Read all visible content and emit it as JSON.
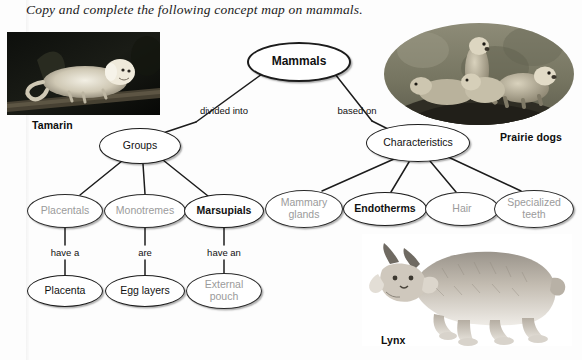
{
  "page": {
    "instruction": "Copy and complete the following concept map on mammals.",
    "background": "#ffffff",
    "ink": "#111111",
    "blank_color": "#9b9b9b"
  },
  "photos": [
    {
      "id": "tamarin",
      "caption": "Tamarin",
      "shape": "rectangle",
      "subject": "white-headed tamarin monkey lying on a branch"
    },
    {
      "id": "prairie-dogs",
      "caption": "Prairie dogs",
      "shape": "ellipse",
      "subject": "four prairie dogs standing on a burrow mound"
    },
    {
      "id": "lynx",
      "caption": "Lynx",
      "shape": "cutout",
      "subject": "canada lynx walking, cut out on white"
    }
  ],
  "concept_map": {
    "title_node": "Mammals",
    "nodes": [
      {
        "id": "mammals",
        "label": "Mammals",
        "style": "root",
        "x": 299,
        "y": 62,
        "w": 104,
        "h": 40
      },
      {
        "id": "groups",
        "label": "Groups",
        "style": "plain",
        "x": 140,
        "y": 146,
        "w": 82,
        "h": 36
      },
      {
        "id": "characteristics",
        "label": "Characteristics",
        "style": "plain",
        "x": 418,
        "y": 143,
        "w": 104,
        "h": 38
      },
      {
        "id": "placentals",
        "label": "Placentals",
        "style": "blank",
        "x": 65,
        "y": 211,
        "w": 76,
        "h": 34
      },
      {
        "id": "monotremes",
        "label": "Monotremes",
        "style": "blank",
        "x": 145,
        "y": 211,
        "w": 82,
        "h": 34
      },
      {
        "id": "marsupials",
        "label": "Marsupials",
        "style": "bold",
        "x": 224,
        "y": 211,
        "w": 80,
        "h": 34
      },
      {
        "id": "placenta",
        "label": "Placenta",
        "style": "plain",
        "x": 65,
        "y": 291,
        "w": 76,
        "h": 32
      },
      {
        "id": "egg-layers",
        "label": "Egg layers",
        "style": "plain",
        "x": 145,
        "y": 291,
        "w": 80,
        "h": 32
      },
      {
        "id": "external-pouch",
        "label": "External\npouch",
        "style": "blank",
        "x": 224,
        "y": 291,
        "w": 76,
        "h": 36
      },
      {
        "id": "mammary-glands",
        "label": "Mammary\nglands",
        "style": "blank",
        "x": 304,
        "y": 209,
        "w": 78,
        "h": 38
      },
      {
        "id": "endotherms",
        "label": "Endotherms",
        "style": "bold",
        "x": 385,
        "y": 209,
        "w": 84,
        "h": 34
      },
      {
        "id": "hair",
        "label": "Hair",
        "style": "blank",
        "x": 462,
        "y": 209,
        "w": 74,
        "h": 34
      },
      {
        "id": "specialized-teeth",
        "label": "Specialized\nteeth",
        "style": "blank",
        "x": 534,
        "y": 209,
        "w": 80,
        "h": 38
      }
    ],
    "edge_labels": [
      {
        "id": "divided-into",
        "label": "divided into",
        "x": 224,
        "y": 110
      },
      {
        "id": "based-on",
        "label": "based on",
        "x": 357,
        "y": 110
      },
      {
        "id": "have-a",
        "label": "have a",
        "x": 65,
        "y": 252
      },
      {
        "id": "are",
        "label": "are",
        "x": 145,
        "y": 252
      },
      {
        "id": "have-an",
        "label": "have an",
        "x": 224,
        "y": 252
      }
    ]
  }
}
